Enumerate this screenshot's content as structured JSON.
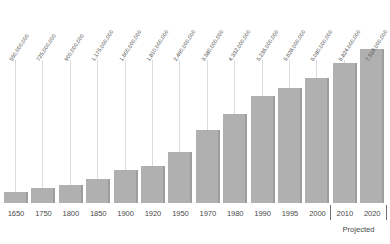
{
  "chart_data": {
    "type": "bar",
    "title": "",
    "xlabel": "",
    "ylabel": "",
    "grid": false,
    "legend": null,
    "ylim": [
      0,
      7518000000
    ],
    "categories": [
      "1650",
      "1750",
      "1800",
      "1850",
      "1900",
      "1920",
      "1950",
      "1970",
      "1980",
      "1990",
      "1995",
      "2000",
      "2010",
      "2020"
    ],
    "values": [
      550000000,
      725000000,
      900000000,
      1175000000,
      1600000000,
      1810000000,
      2490000000,
      3580000000,
      4332000000,
      5236000000,
      5628000000,
      6080000000,
      6824000000,
      7518000000
    ],
    "value_labels": [
      "550,000,000",
      "725,000,000",
      "900,000,000",
      "1,175,000,000",
      "1,600,000,000",
      "1,810,000,000",
      "2,490,000,000",
      "3,580,000,000",
      "4,332,000,000",
      "5,236,000,000",
      "5,628,000,000",
      "6,080,000,000",
      "6,824,000,000",
      "7,518,000,000"
    ],
    "annotations": [
      {
        "text": "Projected",
        "covers": [
          "2010",
          "2020"
        ]
      }
    ],
    "colors": {
      "bar_fill": "#b0b0b0",
      "bar_edge": "#9d9d9d",
      "leader_line": "#dcdcdc",
      "text": "#4a4a4a",
      "background": "#ffffff"
    }
  },
  "projected": {
    "caption": "Projected"
  }
}
